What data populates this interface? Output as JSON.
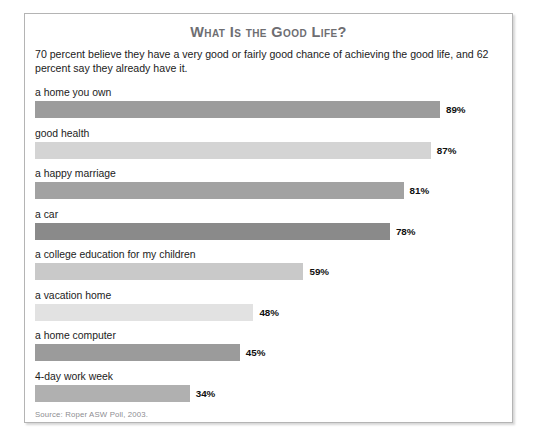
{
  "figure": {
    "title": "What Is the Good Life?",
    "intro": "70 percent believe they have a very good or fairly good chance of achieving the good life, and 62 percent say they already have it.",
    "source": "Source: Roper ASW Poll, 2003."
  },
  "chart_data": {
    "type": "bar",
    "orientation": "horizontal",
    "title": "What Is the Good Life?",
    "subtitle": "70 percent believe they have a very good or fairly good chance of achieving the good life, and 62 percent say they already have it.",
    "xlabel": "",
    "ylabel": "",
    "xlim": [
      0,
      100
    ],
    "grid": false,
    "legend": "none",
    "value_suffix": "%",
    "source": "Source: Roper ASW Poll, 2003.",
    "categories": [
      "a home you own",
      "good health",
      "a happy marriage",
      "a car",
      "a college education for my children",
      "a vacation home",
      "a home computer",
      "4-day work week"
    ],
    "values": [
      89,
      87,
      81,
      78,
      59,
      48,
      45,
      34
    ],
    "value_labels": [
      "89%",
      "87%",
      "81%",
      "78%",
      "59%",
      "48%",
      "45%",
      "34%"
    ],
    "bar_colors": [
      "#9c9c9c",
      "#d4d4d4",
      "#a2a2a2",
      "#8a8a8a",
      "#c9c9c9",
      "#e2e2e2",
      "#9b9b9b",
      "#b0b0b0"
    ],
    "bars": [
      {
        "label": "a home you own",
        "value": 89,
        "value_label": "89%",
        "color": "#9c9c9c"
      },
      {
        "label": "good health",
        "value": 87,
        "value_label": "87%",
        "color": "#d4d4d4"
      },
      {
        "label": "a happy marriage",
        "value": 81,
        "value_label": "81%",
        "color": "#a2a2a2"
      },
      {
        "label": "a car",
        "value": 78,
        "value_label": "78%",
        "color": "#8a8a8a"
      },
      {
        "label": "a college education for my children",
        "value": 59,
        "value_label": "59%",
        "color": "#c9c9c9"
      },
      {
        "label": "a vacation home",
        "value": 48,
        "value_label": "48%",
        "color": "#e2e2e2"
      },
      {
        "label": "a home computer",
        "value": 45,
        "value_label": "45%",
        "color": "#9b9b9b"
      },
      {
        "label": "4-day work week",
        "value": 34,
        "value_label": "34%",
        "color": "#b0b0b0"
      }
    ]
  }
}
